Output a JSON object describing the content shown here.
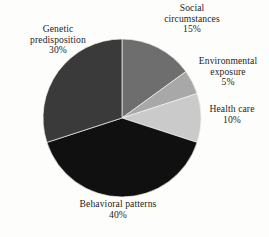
{
  "figure": {
    "background_color": "#fdfdfb",
    "text_color": "#1d1d1d"
  },
  "chart_data": {
    "type": "pie",
    "title": "",
    "subtitle": "",
    "xlabel": "",
    "ylabel": "",
    "legend_position": "none",
    "grid": false,
    "labels_outside": true,
    "start_angle_deg": 0,
    "direction": "clockwise",
    "center": {
      "x": 122,
      "y": 118
    },
    "radius": 79,
    "categories": [
      "Social circumstances",
      "Environmental exposure",
      "Health care",
      "Behavioral patterns",
      "Genetic predisposition"
    ],
    "values": [
      15,
      5,
      10,
      40,
      30
    ],
    "unit": "%",
    "total": 100,
    "colors": [
      "#6e6e6e",
      "#a8a8a8",
      "#cacaca",
      "#101010",
      "#3a3a3a"
    ],
    "slices": [
      {
        "name": "Social circumstances",
        "name_line1": "Social",
        "name_line2": "circumstances",
        "value": 15,
        "percent_label": "15%",
        "color": "#6e6e6e",
        "start_angle_deg": 0,
        "end_angle_deg": 54
      },
      {
        "name": "Environmental exposure",
        "name_line1": "Environmental",
        "name_line2": "exposure",
        "value": 5,
        "percent_label": "5%",
        "color": "#a8a8a8",
        "start_angle_deg": 54,
        "end_angle_deg": 72
      },
      {
        "name": "Health care",
        "name_line1": "Health care",
        "name_line2": "",
        "value": 10,
        "percent_label": "10%",
        "color": "#cacaca",
        "start_angle_deg": 72,
        "end_angle_deg": 108
      },
      {
        "name": "Behavioral patterns",
        "name_line1": "Behavioral patterns",
        "name_line2": "",
        "value": 40,
        "percent_label": "40%",
        "color": "#101010",
        "start_angle_deg": 108,
        "end_angle_deg": 252
      },
      {
        "name": "Genetic predisposition",
        "name_line1": "Genetic",
        "name_line2": "predisposition",
        "value": 30,
        "percent_label": "30%",
        "color": "#3a3a3a",
        "start_angle_deg": 252,
        "end_angle_deg": 360
      }
    ]
  }
}
